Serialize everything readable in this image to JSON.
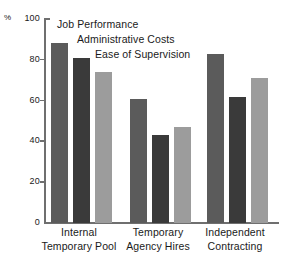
{
  "chart_data": {
    "type": "bar",
    "title": "",
    "xlabel": "",
    "ylabel": "%",
    "ylim": [
      0,
      100
    ],
    "yticks": [
      0,
      20,
      40,
      60,
      80,
      100
    ],
    "grid": false,
    "legend_position": "top-left-inline",
    "categories": [
      "Internal Temporary Pool",
      "Temporary Agency Hires",
      "Independent Contracting"
    ],
    "category_lines": [
      [
        "Internal",
        "Temporary Pool"
      ],
      [
        "Temporary",
        "Agency Hires"
      ],
      [
        "Independent",
        "Contracting"
      ]
    ],
    "series": [
      {
        "name": "Job Performance",
        "color": "#5b5b5b",
        "values": [
          88,
          61,
          83
        ]
      },
      {
        "name": "Administrative Costs",
        "color": "#3a3a3a",
        "values": [
          81,
          43,
          62
        ]
      },
      {
        "name": "Ease of Supervision",
        "color": "#9c9c9c",
        "values": [
          74,
          47,
          71
        ]
      }
    ]
  },
  "axis": {
    "unit_label": "%",
    "tick_labels": [
      "0",
      "20",
      "40",
      "60",
      "80",
      "100"
    ]
  }
}
